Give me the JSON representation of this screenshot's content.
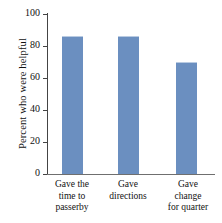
{
  "chart_data": {
    "type": "bar",
    "title": "",
    "subtitle": "",
    "xlabel": "",
    "ylabel": "Percent who were helpful",
    "categories": [
      "Gave the time to passerby",
      "Gave directions",
      "Gave change for quarter"
    ],
    "category_lines": [
      [
        "Gave the",
        "time to",
        "passerby"
      ],
      [
        "Gave",
        "directions"
      ],
      [
        "Gave",
        "change",
        "for quarter"
      ]
    ],
    "values": [
      86,
      86,
      70
    ],
    "ylim": [
      0,
      100
    ],
    "yticks": [
      0,
      20,
      40,
      60,
      80,
      100
    ],
    "ytick_labels": [
      "0",
      "20",
      "40",
      "60",
      "80",
      "100"
    ],
    "grid": false,
    "legend": false,
    "legend_position": "none",
    "bar_color": "#6b8fc0",
    "axis_color": "#444444",
    "background_color": "#ffffff"
  }
}
